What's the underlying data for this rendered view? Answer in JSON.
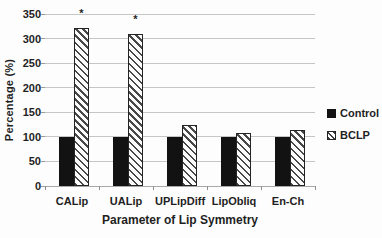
{
  "chart_data": {
    "type": "bar",
    "title": "",
    "xlabel": "Parameter of Lip Symmetry",
    "ylabel": "Percentage (%)",
    "categories": [
      "CALip",
      "UALip",
      "UPLipDiff",
      "LipObliq",
      "En-Ch"
    ],
    "series": [
      {
        "name": "Control",
        "style": "solid",
        "values": [
          100,
          100,
          100,
          100,
          100
        ]
      },
      {
        "name": "BCLP",
        "style": "hatched",
        "values": [
          322,
          310,
          124,
          107,
          114
        ]
      }
    ],
    "ylim": [
      0,
      350
    ],
    "yticks": [
      0,
      50,
      100,
      150,
      200,
      250,
      300,
      350
    ],
    "grid": "horizontal",
    "legend_position": "right",
    "annotations": [
      {
        "text": "*",
        "category": "CALip",
        "series": "BCLP",
        "y": 353
      },
      {
        "text": "*",
        "category": "UALip",
        "series": "BCLP",
        "y": 339
      }
    ]
  },
  "legend": {
    "items": [
      {
        "label": "Control",
        "marker": "solid-black-square"
      },
      {
        "label": "BCLP",
        "marker": "hatched-square"
      }
    ]
  },
  "colors": {
    "control_bar": "#121212",
    "hatch_stripe": "#484848",
    "gridline": "#c6c6c6",
    "axis_text": "#1f1f1f"
  }
}
